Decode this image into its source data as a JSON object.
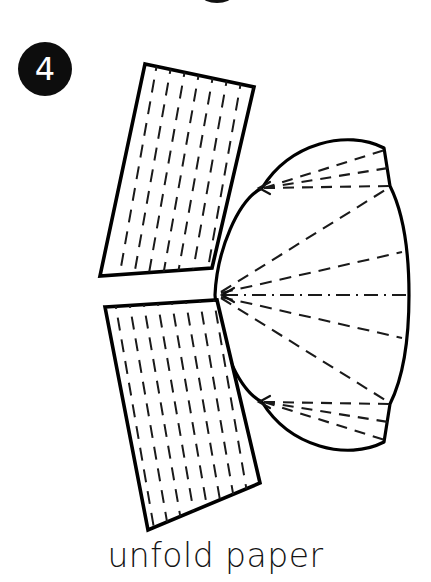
{
  "figure": {
    "step_badge": {
      "number": "4",
      "shape": "filled-circle",
      "fill_color": "#0d0d0d",
      "text_color": "#ffffff",
      "cx": 45,
      "cy": 69,
      "r": 27
    },
    "caption": "unfold paper",
    "caption_color": "#141414",
    "stroke_color": "#000000",
    "fill_color": "#ffffff",
    "background_color": "#ffffff",
    "top_fragment": {
      "name": "cut-off-ellipse-fragment",
      "cx": 217,
      "cy": -4,
      "rx": 15,
      "ry": 7
    },
    "upper_flap": {
      "label": "upper-paper-flap",
      "corners": [
        [
          145,
          64
        ],
        [
          254,
          87
        ],
        [
          212,
          268
        ],
        [
          100,
          276
        ]
      ],
      "hatch_columns": 8,
      "hatch_rows": 9
    },
    "lower_flap": {
      "label": "lower-paper-flap",
      "corners": [
        [
          105,
          307
        ],
        [
          217,
          300
        ],
        [
          260,
          483
        ],
        [
          148,
          530
        ]
      ],
      "hatch_columns": 8,
      "hatch_rows": 9
    },
    "shell": {
      "label": "pleated-fan-body",
      "apex": [
        215,
        295
      ],
      "upper_outline": "M215,295 C218,248 240,198 262,187 C292,142 345,130 383,147 L390,186 C404,214 408,250 409,295",
      "lower_outline": "M215,295 C218,342 240,392 262,403 C292,448 345,460 383,443 L390,404 C404,376 408,340 409,295",
      "right_notch_top": [
        390,
        186
      ],
      "right_notch_bottom": [
        390,
        404
      ],
      "centerline": {
        "style": "dash-dot",
        "from": [
          222,
          295
        ],
        "to": [
          410,
          295
        ]
      },
      "fold_lines_upper": [
        [
          [
            263,
            188
          ],
          [
            386,
            150
          ]
        ],
        [
          [
            263,
            188
          ],
          [
            388,
            168
          ]
        ],
        [
          [
            263,
            188
          ],
          [
            390,
            186
          ]
        ]
      ],
      "fold_lines_lower": [
        [
          [
            263,
            402
          ],
          [
            386,
            440
          ]
        ],
        [
          [
            263,
            402
          ],
          [
            388,
            422
          ]
        ],
        [
          [
            263,
            402
          ],
          [
            390,
            404
          ]
        ]
      ],
      "fan_lines_from_apex": [
        [
          [
            219,
            293
          ],
          [
            390,
            188
          ]
        ],
        [
          [
            219,
            294
          ],
          [
            400,
            254
          ]
        ],
        [
          [
            219,
            296
          ],
          [
            400,
            336
          ]
        ],
        [
          [
            219,
            297
          ],
          [
            390,
            402
          ]
        ]
      ],
      "arrow_heads": [
        {
          "name": "upper-fold-arrow",
          "tip": [
            259,
            188
          ],
          "direction": "left"
        },
        {
          "name": "lower-fold-arrow",
          "tip": [
            259,
            402
          ],
          "direction": "left"
        },
        {
          "name": "apex-arrow",
          "tip": [
            222,
            295
          ],
          "direction": "left"
        }
      ]
    }
  }
}
